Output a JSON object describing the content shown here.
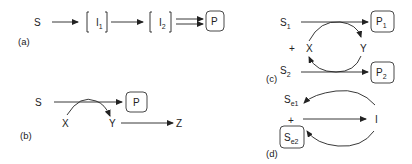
{
  "panels": {
    "a": {
      "label": "(a)",
      "nodes": {
        "S": "S",
        "I1": "I",
        "I1_sub": "1",
        "I2": "I",
        "I2_sub": "2",
        "P": "P"
      }
    },
    "b": {
      "label": "(b)",
      "nodes": {
        "S": "S",
        "P": "P",
        "X": "X",
        "Y": "Y",
        "Z": "Z"
      }
    },
    "c": {
      "label": "(c)",
      "nodes": {
        "S1": "S",
        "S1_sub": "1",
        "P1": "P",
        "P1_sub": "1",
        "plus": "+",
        "X": "X",
        "Y": "Y",
        "S2": "S",
        "S2_sub": "2",
        "P2": "P",
        "P2_sub": "2"
      }
    },
    "d": {
      "label": "(d)",
      "nodes": {
        "Se1": "S",
        "Se1_sub": "e1",
        "plus": "+",
        "I": "I",
        "Se2": "S",
        "Se2_sub": "e2"
      }
    }
  }
}
